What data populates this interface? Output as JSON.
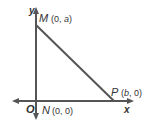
{
  "diagram": {
    "type": "coordinate-triangle",
    "axes": {
      "x_label": "x",
      "y_label": "y",
      "origin_label": "O"
    },
    "points": [
      {
        "name": "M",
        "coords": "(0, a)",
        "x_text": "0",
        "y_text": "a"
      },
      {
        "name": "N",
        "coords": "(0, 0)",
        "x_text": "0",
        "y_text": "0"
      },
      {
        "name": "P",
        "coords": "(b, 0)",
        "x_text": "b",
        "y_text": "0"
      }
    ],
    "segments": [
      "MN",
      "NP",
      "MP"
    ],
    "colors": {
      "lines": "#555555",
      "text": "#333333"
    }
  }
}
